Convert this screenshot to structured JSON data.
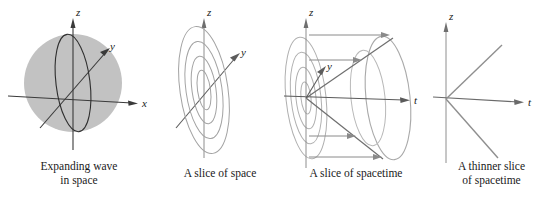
{
  "figure": {
    "background_color": "#ffffff",
    "sphere_fill": "#c2c2c2",
    "line_color": "#3a3a3a",
    "light_line_color": "#9a9a9a",
    "arrow_color": "#8a8a8a",
    "text_color": "#1a1a1a"
  },
  "panels": [
    {
      "id": "expanding-wave-in-space",
      "caption": "Expanding wave\nin space",
      "axes": [
        {
          "name": "z",
          "label": "z",
          "direction": "up"
        },
        {
          "name": "y",
          "label": "y",
          "direction": "up-right"
        },
        {
          "name": "x",
          "label": "x",
          "direction": "right"
        }
      ],
      "elements": [
        {
          "type": "filled-sphere",
          "label": "shaded sphere"
        },
        {
          "type": "ellipse",
          "label": "great circle outline"
        }
      ]
    },
    {
      "id": "a-slice-of-space",
      "caption": "A slice of space",
      "axes": [
        {
          "name": "z",
          "label": "z",
          "direction": "up"
        },
        {
          "name": "y",
          "label": "y",
          "direction": "up-right"
        }
      ],
      "elements": [
        {
          "type": "concentric-ellipses",
          "count": 4,
          "label": "wave fronts"
        }
      ]
    },
    {
      "id": "a-slice-of-spacetime",
      "caption": "A slice of spacetime",
      "axes": [
        {
          "name": "z",
          "label": "z",
          "direction": "up"
        },
        {
          "name": "y",
          "label": "y",
          "direction": "up-right"
        },
        {
          "name": "t",
          "label": "t",
          "direction": "right"
        }
      ],
      "elements": [
        {
          "type": "concentric-ellipses",
          "count": 4,
          "label": "wave fronts at origin"
        },
        {
          "type": "cone",
          "label": "light cone opening along t"
        },
        {
          "type": "arrows",
          "count": 4,
          "label": "expansion arrows along t"
        }
      ]
    },
    {
      "id": "a-thinner-slice-of-spacetime",
      "caption": "A thinner slice\nof spacetime",
      "axes": [
        {
          "name": "z",
          "label": "z",
          "direction": "up"
        },
        {
          "name": "t",
          "label": "t",
          "direction": "right"
        }
      ],
      "elements": [
        {
          "type": "ray",
          "label": "upper light ray"
        },
        {
          "type": "ray",
          "label": "lower light ray"
        }
      ]
    }
  ]
}
